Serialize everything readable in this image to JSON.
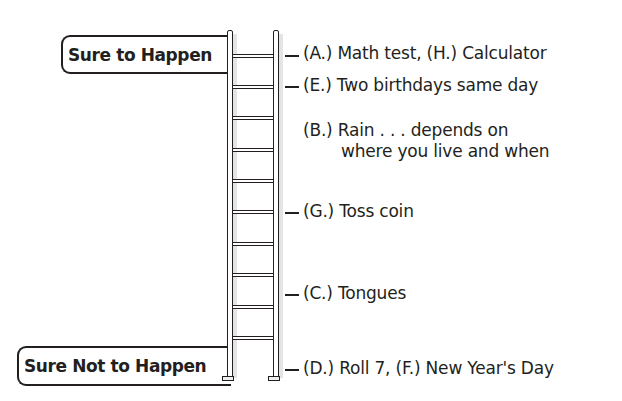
{
  "scale": {
    "top_label": "Sure to Happen",
    "bottom_label": "Sure Not to Happen",
    "rungs": [
      56,
      87,
      118,
      150,
      181,
      212,
      244,
      275,
      307,
      338
    ]
  },
  "events": [
    {
      "id": "A-H",
      "text": "(A.) Math test, (H.) Calculator",
      "tick": true,
      "y": 56
    },
    {
      "id": "E",
      "text": "(E.) Two birthdays same day",
      "tick": true,
      "y": 87
    },
    {
      "id": "B",
      "text": "(B.) Rain . . . depends on",
      "continuation": "where you live and when",
      "tick": false,
      "y": 131
    },
    {
      "id": "G",
      "text": "(G.) Toss coin",
      "tick": true,
      "y": 213
    },
    {
      "id": "C",
      "text": "(C.) Tongues",
      "tick": true,
      "y": 294
    },
    {
      "id": "D-F",
      "text": "(D.) Roll 7, (F.) New Year's Day",
      "tick": true,
      "y": 369
    }
  ]
}
